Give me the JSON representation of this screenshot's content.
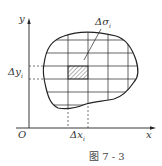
{
  "figure": {
    "caption": "图 7 - 3",
    "labels": {
      "y_axis": "y",
      "x_axis": "x",
      "origin": "O",
      "delta_sigma": "Δσ",
      "delta_sigma_sub": "i",
      "delta_y": "Δy",
      "delta_y_sub": "i",
      "delta_x": "Δx",
      "delta_x_sub": "i"
    },
    "colors": {
      "stroke": "#222222",
      "hatch": "#444444",
      "background": "#ffffff"
    }
  }
}
